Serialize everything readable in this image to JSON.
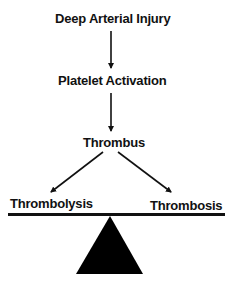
{
  "diagram": {
    "nodes": [
      {
        "id": "injury",
        "label": "Deep Arterial Injury"
      },
      {
        "id": "activation",
        "label": "Platelet Activation"
      },
      {
        "id": "thrombus",
        "label": "Thrombus"
      },
      {
        "id": "thrombolysis",
        "label": "Thrombolysis"
      },
      {
        "id": "thrombosis",
        "label": "Thrombosis"
      }
    ],
    "edges": [
      {
        "from": "injury",
        "to": "activation"
      },
      {
        "from": "activation",
        "to": "thrombus"
      },
      {
        "from": "thrombus",
        "to": "thrombolysis"
      },
      {
        "from": "thrombus",
        "to": "thrombosis"
      }
    ],
    "balance": {
      "left": "Thrombolysis",
      "right": "Thrombosis",
      "fulcrum": "triangle"
    },
    "colors": {
      "ink": "#111111",
      "background": "#ffffff"
    }
  }
}
